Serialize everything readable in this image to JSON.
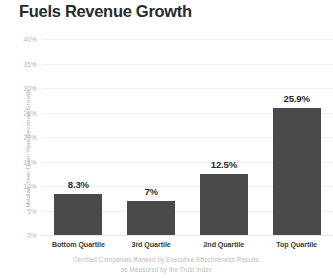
{
  "chart_data": {
    "type": "bar",
    "title": "Fuels Revenue Growth",
    "categories": [
      "Bottom Quartile",
      "3rd Quartile",
      "2nd Quartile",
      "Top Quartile"
    ],
    "values": [
      8.3,
      7,
      12.5,
      25.9
    ],
    "value_labels": [
      "8.3%",
      "7%",
      "12.5%",
      "25.9%"
    ],
    "xlabel": "",
    "ylabel": "Median Year-Over-Year Revenue Growth",
    "ylim": [
      0,
      40
    ],
    "ytick_values": [
      0,
      5,
      10,
      15,
      20,
      25,
      30,
      35,
      40
    ],
    "ytick_labels": [
      "0%",
      "5%",
      "10%",
      "15%",
      "20%",
      "25%",
      "30%",
      "35%",
      "40%"
    ],
    "grid": true,
    "legend": false,
    "series": [
      {
        "name": "Median Year-Over-Year Revenue Growth",
        "values": [
          8.3,
          7,
          12.5,
          25.9
        ],
        "color": "#4a4a4a"
      }
    ],
    "annotations": {
      "footnote_line_1": "Certified Companies Ranked by Executive Effectiveness Results,",
      "footnote_line_2": "as Measured by the Trust Index"
    },
    "colors": {
      "bar": "#4a4a4a",
      "title": "#2b2b2b",
      "value_label": "#2b2b2b",
      "category_label": "#3a3a3a",
      "tick_label": "#b4b4b4",
      "axis_title": "#a8a8a8",
      "gridline": "#f1f1f2",
      "baseline": "#e6e6e7",
      "footnote": "#bcbcbc",
      "background": "#ffffff"
    }
  }
}
